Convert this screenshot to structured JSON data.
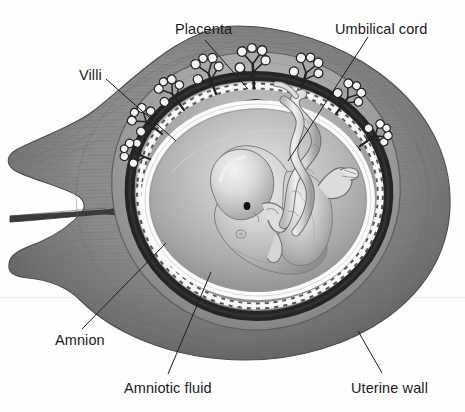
{
  "figure": {
    "type": "anatomical-illustration",
    "width": 465,
    "height": 412,
    "background_color": "#fefefe",
    "style": "grayscale engraving / airbrush medical illustration"
  },
  "labels": [
    {
      "id": "placenta",
      "text": "Placenta",
      "x": 175,
      "y": 22,
      "leader": {
        "x1": 205,
        "y1": 40,
        "x2": 248,
        "y2": 89
      }
    },
    {
      "id": "umbilical",
      "text": "Umbilical cord",
      "x": 335,
      "y": 22,
      "leader": {
        "x1": 368,
        "y1": 37,
        "x2": 288,
        "y2": 161
      }
    },
    {
      "id": "villi",
      "text": "Villi",
      "x": 79,
      "y": 68,
      "leader": {
        "x1": 106,
        "y1": 79,
        "x2": 176,
        "y2": 141
      }
    },
    {
      "id": "amnion",
      "text": "Amnion",
      "x": 55,
      "y": 333,
      "leader": {
        "x1": 82,
        "y1": 329,
        "x2": 166,
        "y2": 243
      }
    },
    {
      "id": "amniotic-fluid",
      "text": "Amniotic fluid",
      "x": 124,
      "y": 381,
      "leader": {
        "x1": 168,
        "y1": 374,
        "x2": 211,
        "y2": 272
      }
    },
    {
      "id": "uterine-wall",
      "text": "Uterine wall",
      "x": 351,
      "y": 381,
      "leader": {
        "x1": 382,
        "y1": 373,
        "x2": 358,
        "y2": 331
      }
    }
  ],
  "structures": {
    "uterine_wall": {
      "name": "Uterine wall",
      "fill": "#8c8c8c",
      "edge": "#5a5a5a"
    },
    "cervix_canal": {
      "name": "Cervical canal",
      "fill": "#3a3a3a"
    },
    "placenta": {
      "name": "Placenta",
      "fill": "#9a9a9a"
    },
    "villi": {
      "name": "Chorionic villi",
      "fill": "#f2f2f2",
      "stroke": "#2e2e2e",
      "count": 8
    },
    "decidua_ring": {
      "name": "Dark decidual ring",
      "fill": "#2b2b2b"
    },
    "amnion": {
      "name": "Amnion membrane",
      "fill": "#f7f7f7"
    },
    "amniotic_fluid": {
      "name": "Amniotic fluid cavity",
      "fill": "#b9b9b9"
    },
    "fetus": {
      "name": "Fetus",
      "fill": "#cfcfcf",
      "eye": "#111111"
    },
    "umbilical_cord": {
      "name": "Umbilical cord",
      "fill": "#e6e6e6",
      "stroke": "#6e6e6e"
    }
  },
  "colors": {
    "ink": "#1b1b1b",
    "leader_line": "#1b1b1b",
    "page": "#fefefe"
  },
  "scan_seam": {
    "y": 297
  }
}
